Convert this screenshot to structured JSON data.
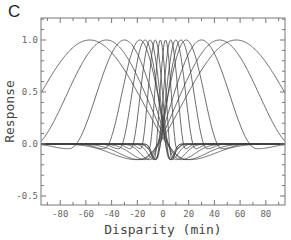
{
  "panel_label": "C",
  "chart_data": {
    "type": "line",
    "title": "",
    "xlabel": "Disparity (min)",
    "ylabel": "Response",
    "xlim": [
      -95,
      95
    ],
    "ylim": [
      -0.6,
      1.2
    ],
    "xticks": [
      -80,
      -60,
      -40,
      -20,
      0,
      20,
      40,
      60,
      80
    ],
    "xtick_labels": [
      "-80",
      "-60",
      "-40",
      "-20",
      "0",
      "20",
      "40",
      "60",
      "80"
    ],
    "yticks": [
      -0.5,
      0.0,
      0.5,
      1.0
    ],
    "ytick_labels": [
      "-0.5",
      "0.0",
      "0.5",
      "1.0"
    ],
    "grid": false,
    "legend": null,
    "series_description": "Family of disparity tuning curves, each peaking at 1.0 at its preferred disparity with a negative side lobe down to about -0.15",
    "series": [
      {
        "name": "tuning -57",
        "peak": -57,
        "width": 30
      },
      {
        "name": "tuning -44",
        "peak": -44,
        "width": 24
      },
      {
        "name": "tuning -30",
        "peak": -30,
        "width": 17
      },
      {
        "name": "tuning -18",
        "peak": -18,
        "width": 11
      },
      {
        "name": "tuning -14",
        "peak": -14,
        "width": 8
      },
      {
        "name": "tuning -10",
        "peak": -10,
        "width": 6
      },
      {
        "name": "tuning -6",
        "peak": -6,
        "width": 4.5
      },
      {
        "name": "tuning -2",
        "peak": -2,
        "width": 3.5
      },
      {
        "name": "tuning 2",
        "peak": 2,
        "width": 3.5
      },
      {
        "name": "tuning 6",
        "peak": 6,
        "width": 4.5
      },
      {
        "name": "tuning 10",
        "peak": 10,
        "width": 6
      },
      {
        "name": "tuning 14",
        "peak": 14,
        "width": 8
      },
      {
        "name": "tuning 18",
        "peak": 18,
        "width": 11
      },
      {
        "name": "tuning 30",
        "peak": 30,
        "width": 17
      },
      {
        "name": "tuning 44",
        "peak": 44,
        "width": 24
      },
      {
        "name": "tuning 57",
        "peak": 57,
        "width": 30
      }
    ],
    "trough_depth": -0.15
  }
}
